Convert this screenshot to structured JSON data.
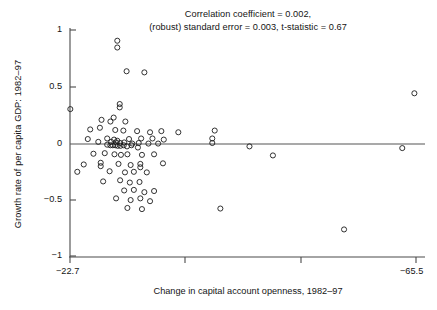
{
  "chart_data": {
    "type": "scatter",
    "title": "Correlation coefficient = 0.002,\n(robust) standard error = 0.003, t-statistic = 0.67",
    "title_lines": [
      "Correlation coefficient = 0.002,",
      "(robust) standard error = 0.003, t-statistic = 0.67"
    ],
    "xlabel": "Change in capital account openness, 1982–97",
    "ylabel": "Growth rate of per capita GDP: 1982–97",
    "grid": false,
    "legend": null,
    "annotations": [
      {
        "text": "horizontal reference line at y = 0",
        "type": "hline",
        "y": 0
      }
    ],
    "xlim": [
      -22.7,
      -65.5
    ],
    "ylim": [
      -1.05,
      1.12
    ],
    "xticks": [
      -22.7,
      -36.97,
      -51.23,
      -65.5
    ],
    "xtick_labels": [
      "−22.7",
      "",
      "",
      "−65.5"
    ],
    "yticks": [
      1,
      0.5,
      0,
      -0.5,
      -1
    ],
    "ytick_labels": [
      "1",
      "0.5",
      "0",
      "−0.5",
      "−1"
    ],
    "series": [
      {
        "name": "countries",
        "marker": "open-circle",
        "marker_color": "#1c1c1c",
        "n_points": 88,
        "points": [
          [
            -22.74,
            0.3
          ],
          [
            -28.55,
            0.905
          ],
          [
            -28.55,
            0.845
          ],
          [
            -29.7,
            0.635
          ],
          [
            -31.9,
            0.625
          ],
          [
            -28.85,
            0.345
          ],
          [
            -28.85,
            0.315
          ],
          [
            -26.6,
            0.205
          ],
          [
            -28.1,
            0.225
          ],
          [
            -27.7,
            0.19
          ],
          [
            -29.55,
            0.19
          ],
          [
            -25.2,
            0.12
          ],
          [
            -26.4,
            0.135
          ],
          [
            -28.3,
            0.115
          ],
          [
            -29.3,
            0.11
          ],
          [
            -31.0,
            0.105
          ],
          [
            -32.6,
            0.095
          ],
          [
            -34.0,
            0.105
          ],
          [
            -36.1,
            0.095
          ],
          [
            -40.6,
            0.11
          ],
          [
            -24.9,
            0.035
          ],
          [
            -27.3,
            0.04
          ],
          [
            -28.15,
            0.03
          ],
          [
            -28.55,
            0.02
          ],
          [
            -30.0,
            0.035
          ],
          [
            -31.5,
            0.04
          ],
          [
            -32.9,
            0.04
          ],
          [
            -34.3,
            0.03
          ],
          [
            -40.3,
            0.04
          ],
          [
            -40.3,
            0.0
          ],
          [
            -26.2,
            0.01
          ],
          [
            -27.8,
            0.01
          ],
          [
            -28.4,
            0.005
          ],
          [
            -28.9,
            0.0
          ],
          [
            -29.4,
            0.005
          ],
          [
            -30.4,
            -0.005
          ],
          [
            -31.2,
            0.0
          ],
          [
            -32.4,
            -0.005
          ],
          [
            -33.6,
            -0.005
          ],
          [
            -27.3,
            -0.015
          ],
          [
            -27.7,
            -0.02
          ],
          [
            -28.0,
            -0.02
          ],
          [
            -28.3,
            -0.02
          ],
          [
            -28.6,
            -0.025
          ],
          [
            -28.95,
            -0.025
          ],
          [
            -29.35,
            -0.02
          ],
          [
            -29.75,
            -0.03
          ],
          [
            -30.3,
            -0.02
          ],
          [
            -31.1,
            -0.04
          ],
          [
            -44.9,
            -0.03
          ],
          [
            -63.8,
            -0.045
          ],
          [
            -25.6,
            -0.095
          ],
          [
            -27.0,
            -0.09
          ],
          [
            -28.2,
            -0.1
          ],
          [
            -29.0,
            -0.105
          ],
          [
            -29.8,
            -0.1
          ],
          [
            -31.6,
            -0.105
          ],
          [
            -33.1,
            -0.1
          ],
          [
            -47.8,
            -0.11
          ],
          [
            -24.4,
            -0.19
          ],
          [
            -26.5,
            -0.175
          ],
          [
            -26.5,
            -0.205
          ],
          [
            -28.7,
            -0.185
          ],
          [
            -30.2,
            -0.195
          ],
          [
            -31.4,
            -0.185
          ],
          [
            -31.4,
            -0.215
          ],
          [
            -34.2,
            -0.18
          ],
          [
            -23.6,
            -0.255
          ],
          [
            -27.6,
            -0.25
          ],
          [
            -29.5,
            -0.26
          ],
          [
            -30.6,
            -0.255
          ],
          [
            -32.2,
            -0.26
          ],
          [
            -26.8,
            -0.34
          ],
          [
            -28.9,
            -0.33
          ],
          [
            -30.1,
            -0.35
          ],
          [
            -31.3,
            -0.345
          ],
          [
            -29.4,
            -0.42
          ],
          [
            -30.6,
            -0.415
          ],
          [
            -31.9,
            -0.435
          ],
          [
            -33.1,
            -0.425
          ],
          [
            -28.4,
            -0.49
          ],
          [
            -30.2,
            -0.505
          ],
          [
            -31.4,
            -0.49
          ],
          [
            -32.6,
            -0.515
          ],
          [
            -29.8,
            -0.575
          ],
          [
            -31.6,
            -0.585
          ],
          [
            -41.3,
            -0.58
          ],
          [
            -56.6,
            -0.765
          ],
          [
            -65.3,
            0.44
          ]
        ]
      }
    ]
  },
  "axes": {
    "y_tick_positions_px": [
      30,
      87,
      144,
      200,
      256
    ],
    "x_tick_positions_px": [
      70,
      185,
      301,
      416
    ],
    "zero_line_px": {
      "y": 144,
      "x_start": 70,
      "x_end": 425
    }
  }
}
